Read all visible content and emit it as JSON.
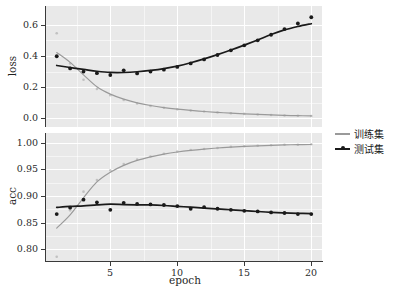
{
  "chart_data": {
    "type": "line",
    "title": "",
    "xlabel": "epoch",
    "xlim": [
      0.2,
      20.8
    ],
    "xticks": [
      5,
      10,
      15,
      20
    ],
    "xticklabels": [
      "5",
      "10",
      "15",
      "20"
    ],
    "grid": true,
    "legend_position": "right",
    "legend": [
      "训练集",
      "测试集"
    ],
    "colors": {
      "train": "#9a9a9a",
      "test": "#1a1a1a",
      "panel_background": "#e9e9e9",
      "grid": "#ffffff",
      "axis": "#3a3a3a",
      "figure_background": "#ffffff"
    },
    "panels": [
      {
        "ylabel": "loss",
        "ylim": [
          -0.055,
          0.72
        ],
        "yticks": [
          0.0,
          0.2,
          0.4,
          0.6
        ],
        "yticklabels": [
          "0.0",
          "0.2",
          "0.4",
          "0.6"
        ],
        "x": [
          1,
          2,
          3,
          4,
          5,
          6,
          7,
          8,
          9,
          10,
          11,
          12,
          13,
          14,
          15,
          16,
          17,
          18,
          19,
          20
        ],
        "series": [
          {
            "name": "训练集",
            "values": [
              0.545,
              0.352,
              0.248,
              0.188,
              0.148,
              0.118,
              0.096,
              0.08,
              0.068,
              0.058,
              0.05,
              0.044,
              0.038,
              0.033,
              0.029,
              0.025,
              0.022,
              0.019,
              0.017,
              0.015
            ]
          },
          {
            "name": "测试集",
            "values": [
              0.398,
              0.32,
              0.3,
              0.29,
              0.278,
              0.308,
              0.288,
              0.3,
              0.312,
              0.33,
              0.352,
              0.378,
              0.406,
              0.436,
              0.468,
              0.5,
              0.536,
              0.572,
              0.608,
              0.648
            ]
          }
        ]
      },
      {
        "ylabel": "acc",
        "ylim": [
          0.778,
          1.018
        ],
        "yticks": [
          0.8,
          0.85,
          0.9,
          0.95,
          1.0
        ],
        "yticklabels": [
          "0.80",
          "0.85",
          "0.90",
          "0.95",
          "1.00"
        ],
        "x": [
          1,
          2,
          3,
          4,
          5,
          6,
          7,
          8,
          9,
          10,
          11,
          12,
          13,
          14,
          15,
          16,
          17,
          18,
          19,
          20
        ],
        "series": [
          {
            "name": "训练集",
            "values": [
              0.786,
              0.873,
              0.908,
              0.93,
              0.948,
              0.96,
              0.968,
              0.974,
              0.979,
              0.983,
              0.986,
              0.988,
              0.99,
              0.992,
              0.993,
              0.994,
              0.995,
              0.996,
              0.996,
              0.997
            ]
          },
          {
            "name": "测试集",
            "values": [
              0.866,
              0.878,
              0.893,
              0.888,
              0.874,
              0.887,
              0.885,
              0.884,
              0.883,
              0.881,
              0.876,
              0.879,
              0.876,
              0.874,
              0.872,
              0.871,
              0.869,
              0.868,
              0.866,
              0.866
            ]
          }
        ]
      }
    ]
  }
}
